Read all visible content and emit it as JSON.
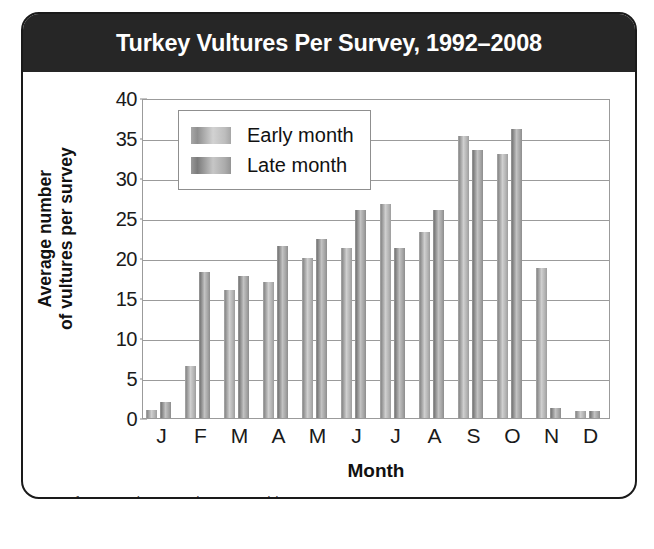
{
  "figure": {
    "title": "Turkey Vultures Per Survey, 1992–2008",
    "source_note": "Data from Hawk Mountain Data Archives"
  },
  "colors": {
    "title_bar_bg": "#262626",
    "title_text": "#ffffff",
    "early_bar": "#b3b3b3",
    "late_bar": "#a4a4a4",
    "gridline": "#9b9b9b",
    "axis_text": "#1a1a1a"
  },
  "legend": {
    "position": "top-left-inside",
    "entries": [
      {
        "label": "Early month",
        "swatch": "early"
      },
      {
        "label": "Late month",
        "swatch": "late"
      }
    ]
  },
  "chart_data": {
    "type": "bar",
    "title": "Turkey Vultures Per Survey, 1992–2008",
    "subtitle": "",
    "xlabel": "Month",
    "ylabel": "Average number\nof vultures per survey",
    "categories": [
      "J",
      "F",
      "M",
      "A",
      "M",
      "J",
      "J",
      "A",
      "S",
      "O",
      "N",
      "D"
    ],
    "category_names": [
      "January",
      "February",
      "March",
      "April",
      "May",
      "June",
      "July",
      "August",
      "September",
      "October",
      "November",
      "December"
    ],
    "series": [
      {
        "name": "Early month",
        "values": [
          1.0,
          6.5,
          16.0,
          17.0,
          20.0,
          21.2,
          26.8,
          23.3,
          35.3,
          33.0,
          18.7,
          0.9
        ]
      },
      {
        "name": "Late month",
        "values": [
          2.0,
          18.3,
          17.7,
          21.5,
          22.4,
          26.0,
          21.2,
          26.0,
          33.5,
          36.1,
          1.3,
          0.9
        ]
      }
    ],
    "ylim": [
      0,
      40
    ],
    "yticks": [
      0,
      5,
      10,
      15,
      20,
      25,
      30,
      35,
      40
    ],
    "ytick_labels": [
      "0",
      "5",
      "10",
      "15",
      "20",
      "25",
      "30",
      "35",
      "40"
    ],
    "grid": "horizontal",
    "legend_position": "upper left"
  }
}
